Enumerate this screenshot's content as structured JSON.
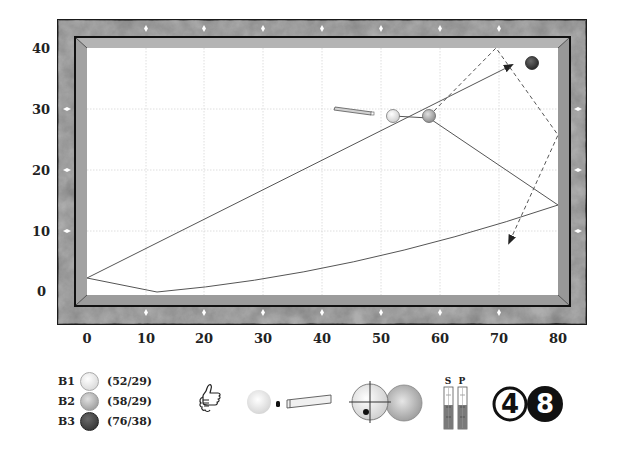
{
  "table": {
    "x_axis_ticks": [
      "0",
      "10",
      "20",
      "30",
      "40",
      "50",
      "60",
      "70",
      "80"
    ],
    "y_axis_ticks": [
      "0",
      "10",
      "20",
      "30",
      "40"
    ],
    "colors": {
      "frame": "#7a7a7a",
      "cushion": "#a9a9a9",
      "cloth": "#ffffff",
      "grid": "#d8d8d8",
      "diamond": "#ffffff",
      "path": "#555555"
    }
  },
  "balls": [
    {
      "id": "B1",
      "coord": "(52/29)",
      "x": 52,
      "y": 29,
      "color": "#f2f2f2"
    },
    {
      "id": "B2",
      "coord": "(58/29)",
      "x": 58,
      "y": 29,
      "color": "#b8b8b8"
    },
    {
      "id": "B3",
      "coord": "(76/38)",
      "x": 76,
      "y": 38,
      "color": "#444444"
    }
  ],
  "indicators": {
    "rating_icon": "thumbs-up-icon",
    "stroke_icon": "cue-stroke-icon",
    "aim_icon": "ball-contact-aim-icon",
    "speed_label": "S",
    "power_label": "P",
    "speed_level": 0.55,
    "power_level": 0.55,
    "cushion_count": "4",
    "difficulty_number": "8"
  }
}
